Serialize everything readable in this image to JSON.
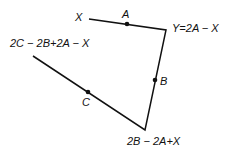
{
  "diagram": {
    "labels": {
      "x": "X",
      "a": "A",
      "y": "Y=2A − X",
      "top_left": "2C − 2B+2A − X",
      "b": "B",
      "c": "C",
      "bottom": "2B − 2A+X"
    },
    "colors": {
      "line": "#111111",
      "background": "#ffffff"
    }
  }
}
